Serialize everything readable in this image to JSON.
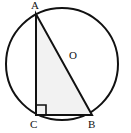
{
  "figure": {
    "background_color": "#ffffff",
    "stroke_color": "#111111",
    "triangle_fill_color": "#f2f2f2",
    "width": 131,
    "height": 133
  },
  "circle": {
    "name": "circumscribed-circle",
    "center_x": 62,
    "center_y": 64,
    "radius": 56,
    "stroke_width": 2
  },
  "center_point": {
    "label": "O",
    "x": 62,
    "y": 64
  },
  "triangle": {
    "name": "inscribed-right-triangle",
    "vertices": [
      {
        "label": "A",
        "x": 36,
        "y": 14
      },
      {
        "label": "C",
        "x": 36,
        "y": 115
      },
      {
        "label": "B",
        "x": 92,
        "y": 115
      }
    ],
    "stroke_width": 2,
    "points_attr": "36,14 36,115 92,115"
  },
  "right_angle_marker": {
    "name": "right-angle-at-C",
    "at_vertex": "C",
    "size": 10,
    "points_attr": "36,105 46,105 46,115"
  },
  "labels": {
    "a": "A",
    "o": "O",
    "c": "C",
    "b": "B"
  }
}
